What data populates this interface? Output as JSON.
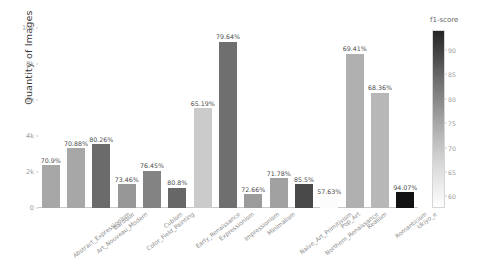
{
  "chart_data": {
    "type": "bar",
    "title": "",
    "xlabel": "",
    "ylabel": "Quantity of Images",
    "ylim": [
      0,
      10000
    ],
    "grid": false,
    "ytick_labels": [
      "0",
      "2k",
      "4k",
      "6k",
      "8k",
      "10k"
    ],
    "ytick_values": [
      0,
      2000,
      4000,
      6000,
      8000,
      10000
    ],
    "categories": [
      "Abstract_Expressionism",
      "Art_Nouveau_Modern",
      "Baroque",
      "Color_Field_Painting",
      "Cubism",
      "Early_Renaissance",
      "Expressionism",
      "Impressionism",
      "Minimalism",
      "Naive_Art_Primitivism",
      "Northern_Renaissance",
      "Pop_Art",
      "Realism",
      "Romanticism",
      "Ukiyo_e"
    ],
    "series": [
      {
        "name": "Quantity of Images",
        "values": [
          2380,
          3320,
          3550,
          1320,
          2080,
          1120,
          5540,
          9230,
          770,
          1650,
          1330,
          660,
          8580,
          6400,
          880
        ]
      },
      {
        "name": "f1-score",
        "values": [
          70.9,
          70.88,
          80.26,
          73.46,
          76.45,
          80.8,
          65.19,
          79.64,
          72.66,
          71.78,
          85.5,
          57.63,
          69.41,
          68.36,
          94.07
        ]
      }
    ],
    "bar_value_labels": [
      "70.9%",
      "70.88%",
      "80.26%",
      "73.46%",
      "76.45%",
      "80.8%",
      "65.19%",
      "79.64%",
      "72.66%",
      "71.78%",
      "85.5%",
      "57.63%",
      "69.41%",
      "68.36%",
      "94.07%"
    ],
    "colorbar": {
      "title": "f1-score",
      "ticks": [
        "90",
        "85",
        "80",
        "75",
        "70",
        "65",
        "60"
      ],
      "tick_values": [
        90,
        85,
        80,
        75,
        70,
        65,
        60
      ],
      "vmin": 57.63,
      "vmax": 94.07,
      "colormap": "greys",
      "position": "right"
    },
    "colors": {
      "axis": "#c9c9c9",
      "tick_text": "#9a9a9a",
      "label_text": "#8d8d8d",
      "value_text": "#4a4a4a",
      "background": "#ffffff"
    }
  }
}
